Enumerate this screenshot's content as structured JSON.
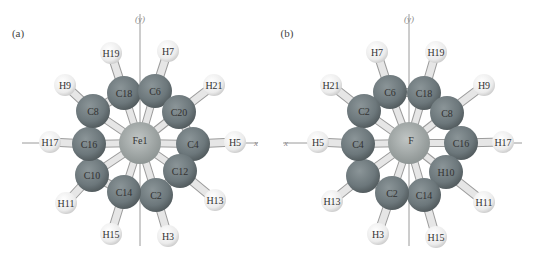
{
  "panels": [
    {
      "id": "a",
      "label": "(a)",
      "center_atom": "Fe1",
      "axis_x_label": "x",
      "axis_y_label": "(y)",
      "carbons": [
        {
          "name": "C18",
          "x": 124,
          "y": 93
        },
        {
          "name": "C6",
          "x": 155,
          "y": 91
        },
        {
          "name": "C20",
          "x": 179,
          "y": 112
        },
        {
          "name": "C4",
          "x": 193,
          "y": 144
        },
        {
          "name": "C12",
          "x": 180,
          "y": 171
        },
        {
          "name": "C2",
          "x": 156,
          "y": 195
        },
        {
          "name": "C14",
          "x": 124,
          "y": 192
        },
        {
          "name": "C10",
          "x": 92,
          "y": 175
        },
        {
          "name": "C16",
          "x": 89,
          "y": 144
        },
        {
          "name": "C8",
          "x": 93,
          "y": 111
        }
      ],
      "hydrogens": [
        {
          "name": "H19",
          "x": 111,
          "y": 53,
          "bond": "C18"
        },
        {
          "name": "H7",
          "x": 168,
          "y": 51,
          "bond": "C6"
        },
        {
          "name": "H21",
          "x": 214,
          "y": 85,
          "bond": "C20"
        },
        {
          "name": "H5",
          "x": 235,
          "y": 142,
          "bond": "C4"
        },
        {
          "name": "H13",
          "x": 215,
          "y": 200,
          "bond": "C12"
        },
        {
          "name": "H3",
          "x": 168,
          "y": 236,
          "bond": "C2"
        },
        {
          "name": "H15",
          "x": 111,
          "y": 234,
          "bond": "C14"
        },
        {
          "name": "H11",
          "x": 66,
          "y": 203,
          "bond": "C10"
        },
        {
          "name": "H17",
          "x": 50,
          "y": 142,
          "bond": "C16"
        },
        {
          "name": "H9",
          "x": 65,
          "y": 85,
          "bond": "C8"
        }
      ]
    },
    {
      "id": "b",
      "label": "(b)",
      "center_atom": "F",
      "axis_x_label": "x",
      "axis_y_label": "(y)",
      "carbons": [
        {
          "name": "C6",
          "x": 390,
          "y": 92
        },
        {
          "name": "C18",
          "x": 424,
          "y": 93
        },
        {
          "name": "C8",
          "x": 447,
          "y": 113
        },
        {
          "name": "C16",
          "x": 461,
          "y": 143
        },
        {
          "name": "H10",
          "x": 446,
          "y": 172
        },
        {
          "name": "C14",
          "x": 424,
          "y": 195
        },
        {
          "name": "C2",
          "x": 392,
          "y": 193
        },
        {
          "name": "",
          "x": 363,
          "y": 176
        },
        {
          "name": "C4",
          "x": 358,
          "y": 144
        },
        {
          "name": "C2",
          "x": 364,
          "y": 111
        }
      ],
      "hydrogens": [
        {
          "name": "H7",
          "x": 377,
          "y": 52,
          "bond": "C6"
        },
        {
          "name": "H19",
          "x": 436,
          "y": 52,
          "bond": "C18"
        },
        {
          "name": "H9",
          "x": 484,
          "y": 85,
          "bond": "C8"
        },
        {
          "name": "H17",
          "x": 503,
          "y": 142,
          "bond": "C16"
        },
        {
          "name": "H11",
          "x": 484,
          "y": 202,
          "bond": "H10"
        },
        {
          "name": "H15",
          "x": 436,
          "y": 237,
          "bond": "C14"
        },
        {
          "name": "H3",
          "x": 378,
          "y": 234,
          "bond": "C2"
        },
        {
          "name": "H13",
          "x": 332,
          "y": 201,
          "bond": "ring-7"
        },
        {
          "name": "H5",
          "x": 318,
          "y": 142,
          "bond": "C4"
        },
        {
          "name": "H21",
          "x": 331,
          "y": 85,
          "bond": "C2"
        }
      ]
    }
  ],
  "colors": {
    "carbon": "#6f7a7f",
    "hydrogen": "#eeeeee",
    "iron": "#a4aaa9",
    "bond": "#d8d8d8",
    "axis": "#9a9a9a"
  }
}
